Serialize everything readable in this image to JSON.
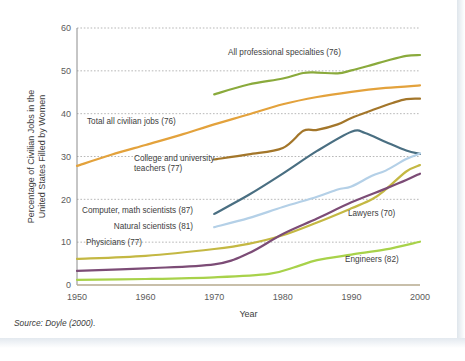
{
  "source_note": "Source: Doyle (2000).",
  "chart_data": {
    "type": "line",
    "title": "",
    "xlabel": "Year",
    "ylabel": "Percentage of Civilian Jobs in the United States Filled by Women",
    "ylabel_line1": "Percentage of Civilian Jobs in the",
    "ylabel_line2": "United States Filled by Women",
    "xlim": [
      1950,
      2000
    ],
    "ylim": [
      0,
      60
    ],
    "xticks": [
      1950,
      1960,
      1970,
      1980,
      1990,
      2000
    ],
    "yticks": [
      0,
      10,
      20,
      30,
      40,
      50,
      60
    ],
    "grid": "horizontal-dotted",
    "legend": "inline-annotations",
    "series": [
      {
        "name": "All professional specialties (76)",
        "label_lines": [
          "All professional specialties (76)"
        ],
        "color": "#8aaa3c",
        "x": [
          1970,
          1975,
          1980,
          1983,
          1985,
          1988,
          1990,
          1993,
          1995,
          1998,
          2000
        ],
        "values": [
          44.5,
          46.8,
          48.2,
          49.5,
          49.6,
          49.4,
          50.1,
          51.4,
          52.3,
          53.5,
          53.7
        ]
      },
      {
        "name": "Total all civilian jobs (76)",
        "label_lines": [
          "Total all civilian jobs (76)"
        ],
        "color": "#e3a23c",
        "x": [
          1950,
          1955,
          1960,
          1965,
          1970,
          1975,
          1980,
          1985,
          1990,
          1995,
          2000
        ],
        "values": [
          27.8,
          30.4,
          32.7,
          35.0,
          37.5,
          39.8,
          42.2,
          43.9,
          45.1,
          46.0,
          46.6
        ]
      },
      {
        "name": "College and university teachers (77)",
        "label_lines": [
          "College and university",
          "teachers (77)"
        ],
        "color": "#a3762a",
        "x": [
          1970,
          1975,
          1980,
          1983,
          1985,
          1988,
          1990,
          1993,
          1996,
          1998,
          2000
        ],
        "values": [
          29.3,
          30.5,
          32.0,
          36.0,
          36.2,
          37.5,
          39.0,
          40.8,
          42.5,
          43.4,
          43.5
        ]
      },
      {
        "name": "Computer, math scientists (87)",
        "label_lines": [
          "Computer, math scientists (87)"
        ],
        "color": "#4a6f82",
        "x": [
          1970,
          1975,
          1980,
          1985,
          1990,
          1992,
          1995,
          1998,
          2000
        ],
        "values": [
          16.6,
          21.0,
          26.0,
          31.3,
          35.8,
          35.5,
          33.4,
          31.4,
          30.6
        ]
      },
      {
        "name": "Natural scientists (81)",
        "label_lines": [
          "Natural scientists (81)"
        ],
        "color": "#b4d0e7",
        "x": [
          1970,
          1975,
          1980,
          1985,
          1988,
          1990,
          1993,
          1995,
          1998,
          2000
        ],
        "values": [
          13.5,
          15.6,
          18.2,
          20.6,
          22.3,
          23.0,
          25.5,
          26.7,
          29.4,
          30.7
        ]
      },
      {
        "name": "Physicians (77)",
        "label_lines": [
          "Physicians (77)"
        ],
        "color": "#c4b843",
        "x": [
          1950,
          1960,
          1970,
          1975,
          1980,
          1985,
          1990,
          1993,
          1995,
          1998,
          2000
        ],
        "values": [
          6.1,
          6.8,
          8.4,
          9.6,
          11.6,
          14.6,
          17.9,
          20.0,
          22.3,
          26.5,
          28.0
        ]
      },
      {
        "name": "Lawyers (70)",
        "label_lines": [
          "Lawyers (70)"
        ],
        "color": "#7c4c76",
        "x": [
          1950,
          1960,
          1970,
          1975,
          1980,
          1985,
          1990,
          1995,
          1998,
          2000
        ],
        "values": [
          3.3,
          3.9,
          4.8,
          7.4,
          11.9,
          15.5,
          19.3,
          22.5,
          24.5,
          26.0
        ]
      },
      {
        "name": "Engineers (82)",
        "label_lines": [
          "Engineers (82)"
        ],
        "color": "#a8d24a",
        "x": [
          1950,
          1960,
          1970,
          1978,
          1982,
          1985,
          1990,
          1995,
          2000
        ],
        "values": [
          1.2,
          1.4,
          1.8,
          2.6,
          4.3,
          5.8,
          7.1,
          8.3,
          10.1
        ]
      }
    ],
    "annotations": [
      {
        "text_key": 0,
        "x_px": 228,
        "y_px": 55,
        "anchor": "start"
      },
      {
        "text_key": 1,
        "x_px": 87,
        "y_px": 124,
        "anchor": "start"
      },
      {
        "text_key": 2,
        "x_px": 134,
        "y_px": 161,
        "anchor": "start"
      },
      {
        "text_key": 3,
        "x_px": 193,
        "y_px": 213,
        "anchor": "end"
      },
      {
        "text_key": 4,
        "x_px": 193,
        "y_px": 229,
        "anchor": "end"
      },
      {
        "text_key": 5,
        "x_px": 86,
        "y_px": 245,
        "anchor": "start"
      },
      {
        "text_key": 6,
        "x_px": 348,
        "y_px": 216,
        "anchor": "start"
      },
      {
        "text_key": 7,
        "x_px": 345,
        "y_px": 262,
        "anchor": "start"
      }
    ]
  }
}
